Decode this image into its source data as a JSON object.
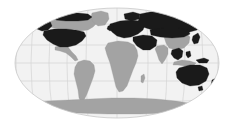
{
  "figure": {
    "type": "world-map",
    "projection": "elliptical (Robinson/Mollweide-style) world projection",
    "title": "",
    "caption": "",
    "width": 236,
    "height": 129
  },
  "colors": {
    "background": "#ffffff",
    "ocean": "#f2f2f2",
    "graticule": "#d4d4d4",
    "outline": "#c8c8c8",
    "land_highlighted": "#1a1a1a",
    "land_plain": "#a3a3a3",
    "land_plain_edge": "#9a9a9a"
  },
  "graticule": {
    "visible": true,
    "meridian_spacing_deg": 30,
    "parallel_spacing_deg": 30,
    "meridian_count": 11,
    "parallel_count": 5
  },
  "ellipse": {
    "center_x": 117,
    "center_y": 63,
    "radius_x": 102,
    "radius_y": 55
  },
  "legend": {
    "visible": false,
    "entries": [
      {
        "label": "Highlighted",
        "color": "#1a1a1a"
      },
      {
        "label": "Other land",
        "color": "#a3a3a3"
      }
    ]
  },
  "regions": {
    "highlighted": [
      "Alaska",
      "Canada (northern/arctic)",
      "United States",
      "Greenland (partial)",
      "Europe",
      "Russia",
      "Central Asia",
      "Mongolia",
      "Middle East",
      "Southeast Asia",
      "Japan",
      "Australia",
      "New Zealand"
    ],
    "plain": [
      "Canada (central)",
      "Mexico",
      "Central America",
      "South America",
      "Africa",
      "China",
      "India",
      "Indonesia",
      "Antarctica"
    ]
  }
}
